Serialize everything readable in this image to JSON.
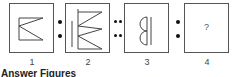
{
  "figures": [
    {
      "label": "1",
      "description": "Single zigzag (two diagonals) attached to vertical line"
    },
    {
      "label": "2",
      "description": "Double zigzag attached to vertical line with separate vertical bar on left"
    },
    {
      "label": "3",
      "description": "Two half-circles attached to vertical line with a second vertical line"
    },
    {
      "label": "4",
      "content": "?"
    }
  ],
  "separators": [
    "single-colon",
    "double-colon",
    "single-colon"
  ],
  "footer": {
    "label": "Answer Figures"
  }
}
